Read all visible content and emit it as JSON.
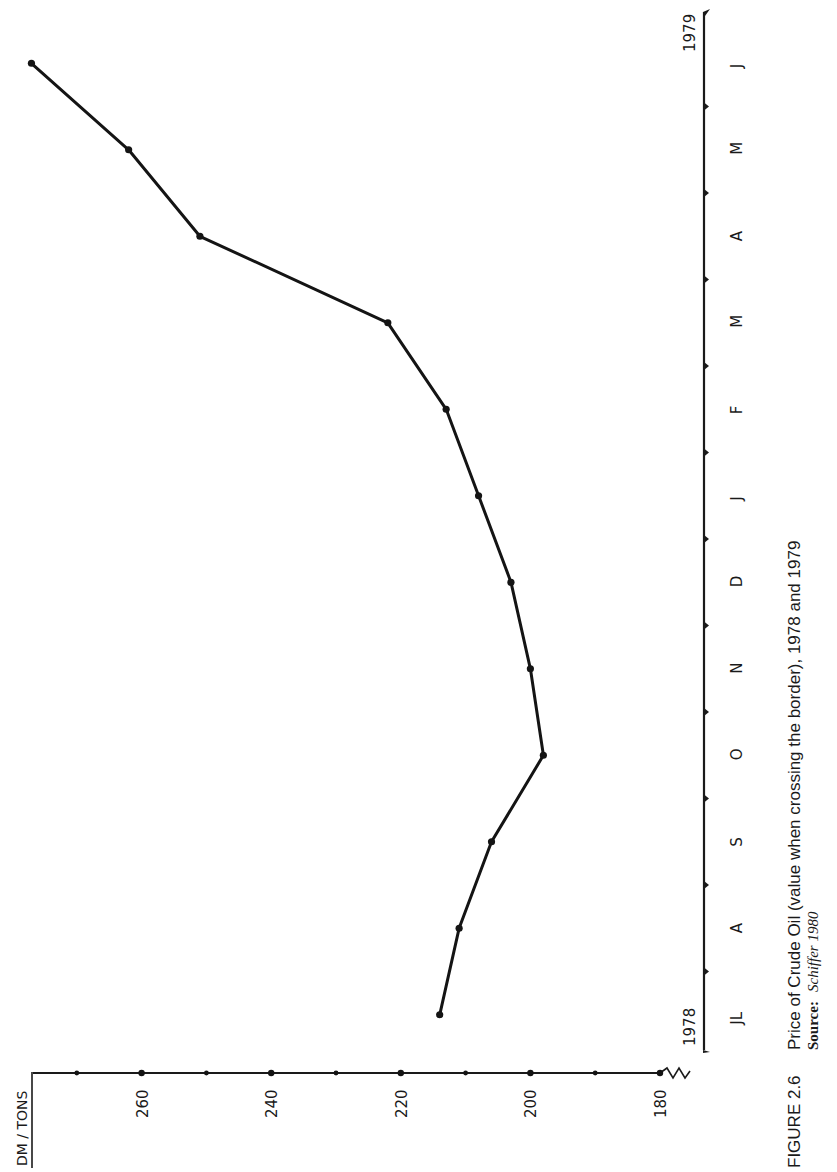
{
  "figure": {
    "number_label": "FIGURE 2.6",
    "title": "Price of Crude Oil (value when crossing the border), 1978 and 1979",
    "source_label": "Source:",
    "source_value": "Schiffer 1980"
  },
  "axes": {
    "y_unit_label": "DM / TONS",
    "y_tick_labels": [
      "260",
      "240",
      "220",
      "200",
      "180"
    ],
    "x_start_year": "1978",
    "x_end_year": "1979",
    "orientation": "rotated 90° counter-clockwise on page"
  },
  "chart_data": {
    "type": "line",
    "title": "Price of Crude Oil (value when crossing the border), 1978 and 1979",
    "xlabel": "Month (July 1978 – June 1979)",
    "ylabel": "DM / TONS",
    "categories": [
      "JL",
      "A",
      "S",
      "O",
      "N",
      "D",
      "J",
      "F",
      "M",
      "A",
      "M",
      "J"
    ],
    "series": [
      {
        "name": "Crude oil price",
        "values": [
          214,
          211,
          206,
          198,
          200,
          203,
          208,
          213,
          222,
          251,
          262,
          277
        ]
      }
    ],
    "year_markers": {
      "start": "1978",
      "end": "1979"
    },
    "ylim": [
      180,
      275
    ],
    "y_ticks": [
      180,
      190,
      200,
      210,
      220,
      230,
      240,
      250,
      260,
      270
    ],
    "y_tick_labels_shown": [
      180,
      200,
      220,
      240,
      260
    ],
    "y_axis_break": true,
    "grid": false,
    "legend": "none",
    "source": "Schiffer 1980"
  }
}
